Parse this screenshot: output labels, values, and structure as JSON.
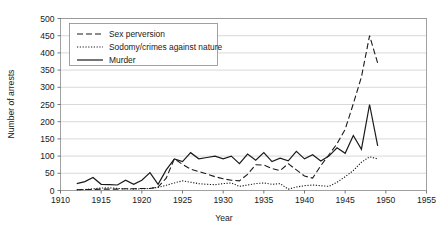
{
  "chart_data": {
    "type": "line",
    "title": "",
    "xlabel": "Year",
    "ylabel": "Number of arrests",
    "xlim": [
      1910,
      1955
    ],
    "ylim": [
      0,
      500
    ],
    "xticks": [
      1910,
      1915,
      1920,
      1925,
      1930,
      1935,
      1940,
      1945,
      1950,
      1955
    ],
    "yticks": [
      0,
      50,
      100,
      150,
      200,
      250,
      300,
      350,
      400,
      450,
      500
    ],
    "grid": "horizontal",
    "legend_position": "upper-left-inside",
    "series": [
      {
        "name": "Sex perversion",
        "style": "dashed",
        "x": [
          1912,
          1913,
          1914,
          1915,
          1916,
          1917,
          1918,
          1919,
          1920,
          1921,
          1922,
          1923,
          1924,
          1925,
          1926,
          1927,
          1928,
          1929,
          1930,
          1931,
          1932,
          1933,
          1934,
          1935,
          1936,
          1937,
          1938,
          1939,
          1940,
          1941,
          1942,
          1943,
          1944,
          1945,
          1946,
          1947,
          1948,
          1949
        ],
        "values": [
          2,
          3,
          3,
          4,
          4,
          4,
          5,
          5,
          6,
          6,
          10,
          36,
          92,
          76,
          62,
          55,
          48,
          40,
          34,
          30,
          28,
          47,
          75,
          74,
          64,
          58,
          78,
          60,
          42,
          36,
          72,
          104,
          136,
          178,
          252,
          330,
          450,
          370
        ]
      },
      {
        "name": "Sodomy/crimes against nature",
        "style": "dotted",
        "x": [
          1912,
          1913,
          1914,
          1915,
          1916,
          1917,
          1918,
          1919,
          1920,
          1921,
          1922,
          1923,
          1924,
          1925,
          1926,
          1927,
          1928,
          1929,
          1930,
          1931,
          1932,
          1933,
          1934,
          1935,
          1936,
          1937,
          1938,
          1939,
          1940,
          1941,
          1942,
          1943,
          1944,
          1945,
          1946,
          1947,
          1948,
          1949
        ],
        "values": [
          2,
          3,
          5,
          7,
          8,
          6,
          5,
          4,
          5,
          6,
          9,
          15,
          22,
          28,
          24,
          20,
          18,
          17,
          20,
          22,
          12,
          16,
          20,
          22,
          18,
          20,
          4,
          10,
          14,
          16,
          14,
          12,
          24,
          40,
          58,
          82,
          98,
          92
        ]
      },
      {
        "name": "Murder",
        "style": "solid",
        "x": [
          1912,
          1913,
          1914,
          1915,
          1916,
          1917,
          1918,
          1919,
          1920,
          1921,
          1922,
          1923,
          1924,
          1925,
          1926,
          1927,
          1928,
          1929,
          1930,
          1931,
          1932,
          1933,
          1934,
          1935,
          1936,
          1937,
          1938,
          1939,
          1940,
          1941,
          1942,
          1943,
          1944,
          1945,
          1946,
          1947,
          1948,
          1949
        ],
        "values": [
          20,
          26,
          38,
          18,
          17,
          16,
          30,
          18,
          30,
          52,
          18,
          60,
          92,
          84,
          110,
          92,
          96,
          100,
          92,
          100,
          78,
          106,
          88,
          110,
          84,
          94,
          86,
          114,
          92,
          104,
          86,
          100,
          124,
          108,
          160,
          120,
          250,
          130
        ]
      }
    ]
  },
  "legend": {
    "items": [
      {
        "label": "Sex perversion",
        "style": "dashed"
      },
      {
        "label": "Sodomy/crimes against nature",
        "style": "dotted"
      },
      {
        "label": "Murder",
        "style": "solid"
      }
    ]
  },
  "axes": {
    "y_title": "Number of arrests",
    "x_title": "Year",
    "y_labels": [
      "500",
      "450",
      "400",
      "350",
      "300",
      "250",
      "200",
      "150",
      "100",
      "50",
      "0"
    ],
    "x_labels": [
      "1910",
      "1915",
      "1920",
      "1925",
      "1930",
      "1935",
      "1940",
      "1945",
      "1950",
      "1955"
    ]
  },
  "colors": {
    "line": "#1a1a1a",
    "grid": "#c9c9c9",
    "frame": "#8a8a8a",
    "background": "#ffffff"
  }
}
